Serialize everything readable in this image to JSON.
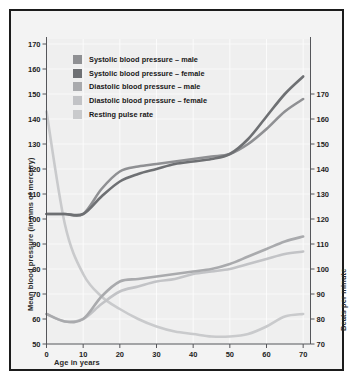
{
  "chart_data": {
    "type": "line",
    "title": "",
    "xlabel": "Age in years",
    "ylabel": "Mean blood pressure (in mms of mercury)",
    "ylabel_right": "Beats per minute",
    "xlim": [
      0,
      72
    ],
    "ylim": [
      50,
      175
    ],
    "ylim_right": [
      70,
      175
    ],
    "xticks": [
      0,
      10,
      20,
      30,
      40,
      50,
      60,
      70
    ],
    "yticks_left": [
      50,
      60,
      70,
      80,
      90,
      100,
      110,
      120,
      130,
      140,
      150,
      160,
      170
    ],
    "yticks_right": [
      70,
      80,
      90,
      100,
      110,
      120,
      130,
      140,
      150,
      160,
      170
    ],
    "grid": true,
    "legend_position": "top-left",
    "x": [
      0,
      5,
      10,
      15,
      20,
      25,
      30,
      35,
      40,
      45,
      50,
      55,
      60,
      65,
      70
    ],
    "series": [
      {
        "name": "Systolic blood pressure – male",
        "color": "#8f9093",
        "axis": "left",
        "values": [
          102,
          102,
          102,
          112,
          119,
          121,
          122,
          123,
          124,
          125,
          126,
          130,
          136,
          143,
          148
        ]
      },
      {
        "name": "Systolic blood pressure – female",
        "color": "#6e7073",
        "axis": "left",
        "values": [
          102,
          102,
          102,
          109,
          115,
          118,
          120,
          122,
          123,
          124,
          126,
          132,
          141,
          150,
          157
        ]
      },
      {
        "name": "Diastolic blood pressure – male",
        "color": "#a9aaad",
        "axis": "left",
        "values": [
          62,
          59,
          60,
          69,
          75,
          76,
          77,
          78,
          79,
          80,
          82,
          85,
          88,
          91,
          93
        ]
      },
      {
        "name": "Diastolic blood pressure – female",
        "color": "#c2c3c6",
        "axis": "left",
        "values": [
          62,
          59,
          60,
          66,
          71,
          73,
          75,
          76,
          78,
          79,
          80,
          82,
          84,
          86,
          87
        ]
      },
      {
        "name": "Resting pulse rate",
        "color": "#c9cacc",
        "axis": "right",
        "values": [
          163,
          118,
          98,
          89,
          84,
          80,
          77,
          75,
          74,
          73,
          73,
          74,
          77,
          81,
          82
        ]
      }
    ]
  },
  "axes": {
    "left_title": "Mean blood pressure (in mms of mercury)",
    "right_title": "Beats per minute",
    "bottom_title": "Age in years",
    "left_ticks": [
      "170",
      "160",
      "150",
      "140",
      "130",
      "120",
      "110",
      "100",
      "90",
      "80",
      "70",
      "60",
      "50"
    ],
    "right_ticks": [
      "170",
      "160",
      "150",
      "140",
      "130",
      "120",
      "110",
      "100",
      "90",
      "80",
      "70"
    ],
    "bottom_ticks": [
      "0",
      "10",
      "20",
      "30",
      "40",
      "50",
      "60",
      "70"
    ]
  },
  "legend": {
    "items": [
      {
        "label": "Systolic blood pressure – male",
        "color": "#8f9093"
      },
      {
        "label": "Systolic blood pressure – female",
        "color": "#6e7073"
      },
      {
        "label": "Diastolic blood pressure – male",
        "color": "#a9aaad"
      },
      {
        "label": "Diastolic blood pressure – female",
        "color": "#c2c3c6"
      },
      {
        "label": "Resting pulse rate",
        "color": "#c9cacc"
      }
    ]
  },
  "colors": {
    "background": "#f3f3f3",
    "plot_background": "#efefef",
    "border": "#1b1b1b",
    "grid": "#ffffff",
    "axis": "#55565a",
    "text": "#1d1d1d"
  }
}
